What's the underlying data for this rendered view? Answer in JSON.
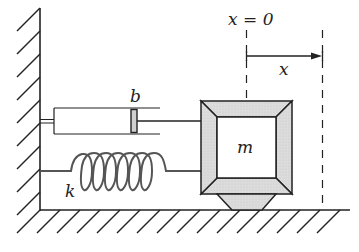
{
  "diagram": {
    "labels": {
      "origin": "x = 0",
      "displacement": "x",
      "damper": "b",
      "mass": "m",
      "spring": "k"
    },
    "components": [
      {
        "name": "wall",
        "type": "fixed support (hatched)"
      },
      {
        "name": "ground",
        "type": "fixed support (hatched)"
      },
      {
        "name": "damper",
        "label": "b",
        "connects": [
          "wall",
          "mass"
        ]
      },
      {
        "name": "spring",
        "label": "k",
        "connects": [
          "wall",
          "mass"
        ]
      },
      {
        "name": "mass",
        "label": "m",
        "rests_on": "ground"
      }
    ],
    "reference_lines": [
      {
        "name": "equilibrium",
        "label": "x = 0",
        "style": "dashed"
      },
      {
        "name": "displaced",
        "style": "dashed"
      }
    ],
    "arrow": {
      "from": "equilibrium",
      "to": "displaced",
      "label": "x"
    },
    "colors": {
      "stroke": "#222222",
      "bevel_fill": "#d9d9d9",
      "background": "#ffffff"
    }
  }
}
